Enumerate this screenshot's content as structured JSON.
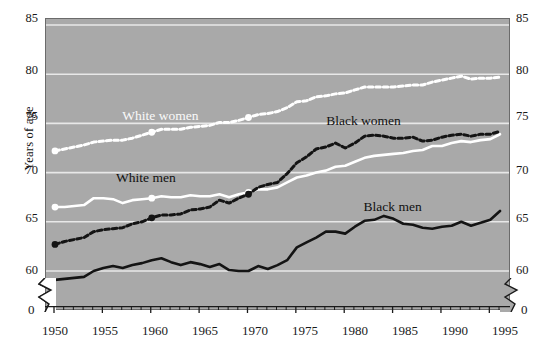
{
  "chart_data": {
    "type": "line",
    "title": "",
    "xlabel": "",
    "ylabel": "Years of age",
    "xlim": [
      1950,
      1996
    ],
    "ylim": [
      59.0,
      85.0
    ],
    "yticks": [
      60,
      65,
      70,
      75,
      80,
      85
    ],
    "xticks": [
      1950,
      1955,
      1960,
      1965,
      1970,
      1975,
      1980,
      1985,
      1990,
      1995
    ],
    "x_minor_tick_interval": 1,
    "axis_break": true,
    "axis_break_label": "0",
    "grid": "horizontal",
    "plot_background": "#a9a9a9",
    "legend_position": "inline-annotations",
    "series": [
      {
        "name": "White women",
        "color": "#ffffff",
        "style": "dashed-with-markers",
        "label_x": 1961,
        "label_y": 75.6,
        "x": [
          1950,
          1951,
          1952,
          1953,
          1954,
          1955,
          1956,
          1957,
          1958,
          1959,
          1960,
          1961,
          1962,
          1963,
          1964,
          1965,
          1966,
          1967,
          1968,
          1969,
          1970,
          1971,
          1972,
          1973,
          1974,
          1975,
          1976,
          1977,
          1978,
          1979,
          1980,
          1981,
          1982,
          1983,
          1984,
          1985,
          1986,
          1987,
          1988,
          1989,
          1990,
          1991,
          1992,
          1993,
          1994,
          1995,
          1996
        ],
        "y": [
          72.2,
          72.4,
          72.6,
          72.8,
          73.1,
          73.2,
          73.3,
          73.3,
          73.5,
          73.8,
          74.1,
          74.4,
          74.4,
          74.4,
          74.6,
          74.7,
          74.8,
          75.1,
          75.1,
          75.3,
          75.6,
          75.9,
          76.0,
          76.2,
          76.6,
          77.2,
          77.3,
          77.7,
          77.8,
          78.0,
          78.1,
          78.4,
          78.7,
          78.7,
          78.7,
          78.7,
          78.8,
          78.9,
          78.9,
          79.2,
          79.4,
          79.6,
          79.8,
          79.5,
          79.6,
          79.6,
          79.7
        ]
      },
      {
        "name": "White men",
        "color": "#ffffff",
        "style": "solid-with-markers",
        "label_x": 1959.5,
        "label_y": 69.3,
        "x": [
          1950,
          1951,
          1952,
          1953,
          1954,
          1955,
          1956,
          1957,
          1958,
          1959,
          1960,
          1961,
          1962,
          1963,
          1964,
          1965,
          1966,
          1967,
          1968,
          1969,
          1970,
          1971,
          1972,
          1973,
          1974,
          1975,
          1976,
          1977,
          1978,
          1979,
          1980,
          1981,
          1982,
          1983,
          1984,
          1985,
          1986,
          1987,
          1988,
          1989,
          1990,
          1991,
          1992,
          1993,
          1994,
          1995,
          1996
        ],
        "y": [
          66.5,
          66.5,
          66.6,
          66.7,
          67.4,
          67.4,
          67.3,
          66.9,
          67.2,
          67.3,
          67.4,
          67.6,
          67.5,
          67.5,
          67.7,
          67.6,
          67.6,
          67.8,
          67.5,
          67.8,
          68.0,
          68.3,
          68.3,
          68.5,
          69.0,
          69.5,
          69.7,
          70.0,
          70.2,
          70.6,
          70.7,
          71.1,
          71.5,
          71.7,
          71.8,
          71.9,
          72.0,
          72.2,
          72.3,
          72.7,
          72.7,
          73.0,
          73.2,
          73.1,
          73.3,
          73.4,
          73.9
        ]
      },
      {
        "name": "Black women",
        "color": "#141414",
        "style": "dashed-with-markers",
        "label_x": 1982,
        "label_y": 75.1,
        "x": [
          1950,
          1951,
          1952,
          1953,
          1954,
          1955,
          1956,
          1957,
          1958,
          1959,
          1960,
          1961,
          1962,
          1963,
          1964,
          1965,
          1966,
          1967,
          1968,
          1969,
          1970,
          1971,
          1972,
          1973,
          1974,
          1975,
          1976,
          1977,
          1978,
          1979,
          1980,
          1981,
          1982,
          1983,
          1984,
          1985,
          1986,
          1987,
          1988,
          1989,
          1990,
          1991,
          1992,
          1993,
          1994,
          1995,
          1996
        ],
        "y": [
          62.7,
          63.0,
          63.2,
          63.4,
          64.0,
          64.2,
          64.3,
          64.4,
          64.8,
          65.0,
          65.4,
          65.7,
          65.7,
          65.8,
          66.2,
          66.3,
          66.5,
          67.2,
          66.9,
          67.4,
          67.8,
          68.5,
          68.8,
          69.0,
          69.9,
          71.0,
          71.6,
          72.4,
          72.6,
          73.0,
          72.5,
          73.0,
          73.7,
          73.8,
          73.7,
          73.5,
          73.5,
          73.6,
          73.2,
          73.3,
          73.6,
          73.8,
          73.9,
          73.7,
          73.9,
          73.9,
          74.2
        ]
      },
      {
        "name": "Black men",
        "color": "#141414",
        "style": "solid",
        "label_x": 1985,
        "label_y": 66.4,
        "x": [
          1950,
          1951,
          1952,
          1953,
          1954,
          1955,
          1956,
          1957,
          1958,
          1959,
          1960,
          1961,
          1962,
          1963,
          1964,
          1965,
          1966,
          1967,
          1968,
          1969,
          1970,
          1971,
          1972,
          1973,
          1974,
          1975,
          1976,
          1977,
          1978,
          1979,
          1980,
          1981,
          1982,
          1983,
          1984,
          1985,
          1986,
          1987,
          1988,
          1989,
          1990,
          1991,
          1992,
          1993,
          1994,
          1995,
          1996
        ],
        "y": [
          59.1,
          59.2,
          59.3,
          59.4,
          60.0,
          60.3,
          60.5,
          60.3,
          60.6,
          60.8,
          61.1,
          61.3,
          60.9,
          60.6,
          60.9,
          60.7,
          60.4,
          60.7,
          60.1,
          60.0,
          60.0,
          60.5,
          60.2,
          60.6,
          61.1,
          62.4,
          62.9,
          63.4,
          64.0,
          64.0,
          63.8,
          64.5,
          65.1,
          65.2,
          65.6,
          65.3,
          64.8,
          64.7,
          64.4,
          64.3,
          64.5,
          64.6,
          65.0,
          64.6,
          64.9,
          65.2,
          66.1
        ]
      }
    ],
    "markers": {
      "description": "Larger circular point markers on the decennial years",
      "years": [
        1950,
        1960,
        1970
      ]
    }
  },
  "axis": {
    "y_title": "Years of age",
    "y_labels_left": [
      "85",
      "80",
      "75",
      "70",
      "65",
      "60",
      "0"
    ],
    "y_labels_right": [
      "85",
      "80",
      "75",
      "70",
      "65",
      "60",
      "0"
    ],
    "x_labels": [
      "1950",
      "1955",
      "1960",
      "1965",
      "1970",
      "1975",
      "1980",
      "1985",
      "1990",
      "1995"
    ]
  },
  "annotations": {
    "white_women": "White women",
    "white_men": "White men",
    "black_women": "Black women",
    "black_men": "Black men"
  },
  "colors": {
    "plot_background": "#a9a9a9",
    "gridline": "#e8e8e8",
    "white_series": "#ffffff",
    "black_series": "#141414",
    "text": "#1a1a1a",
    "page_background": "#ffffff"
  }
}
